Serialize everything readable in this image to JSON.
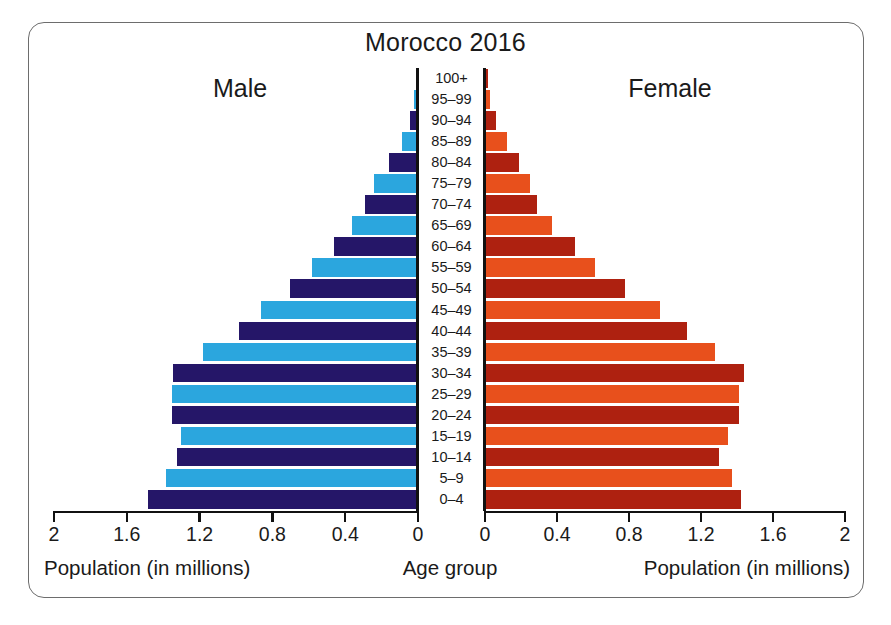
{
  "chart_data": {
    "type": "bar",
    "subtype": "population-pyramid",
    "title": "Morocco 2016",
    "categories": [
      "100+",
      "95–99",
      "90–94",
      "85–89",
      "80–84",
      "75–79",
      "70–74",
      "65–69",
      "60–64",
      "55–59",
      "50–54",
      "45–49",
      "40–44",
      "35–39",
      "30–34",
      "25–29",
      "20–24",
      "15–19",
      "10–14",
      "5–9",
      "0–4"
    ],
    "category_axis_label": "Age group",
    "xlabel": "Population (in millions)",
    "ylabel": "Age group",
    "xlim": [
      0,
      2
    ],
    "xticks": [
      0,
      0.4,
      0.8,
      1.2,
      1.6,
      2
    ],
    "xtick_labels_left": [
      "2",
      "1.6",
      "1.2",
      "0.8",
      "0.4",
      "0"
    ],
    "xtick_labels_right": [
      "0",
      "0.4",
      "0.8",
      "1.2",
      "1.6",
      "2"
    ],
    "grid": false,
    "legend_position": "none",
    "series": [
      {
        "name": "Male",
        "side": "left",
        "values": [
          0.005,
          0.02,
          0.045,
          0.09,
          0.16,
          0.24,
          0.29,
          0.36,
          0.46,
          0.58,
          0.7,
          0.86,
          0.98,
          1.18,
          1.34,
          1.35,
          1.35,
          1.3,
          1.32,
          1.38,
          1.48
        ]
      },
      {
        "name": "Female",
        "side": "right",
        "values": [
          0.008,
          0.025,
          0.06,
          0.12,
          0.19,
          0.25,
          0.29,
          0.37,
          0.5,
          0.61,
          0.78,
          0.97,
          1.12,
          1.28,
          1.44,
          1.41,
          1.41,
          1.35,
          1.3,
          1.37,
          1.42
        ]
      }
    ],
    "colors": {
      "male_dark": "#251668",
      "male_light": "#2BA6DE",
      "female_dark": "#AE2110",
      "female_light": "#E8501C",
      "axis": "#111111",
      "text": "#1a1a1a",
      "frame_border": "#6d6d6d",
      "background": "#ffffff"
    }
  },
  "labels": {
    "title": "Morocco 2016",
    "male": "Male",
    "female": "Female",
    "axis_title_left": "Population (in millions)",
    "axis_title_center": "Age group",
    "axis_title_right": "Population (in millions)"
  }
}
